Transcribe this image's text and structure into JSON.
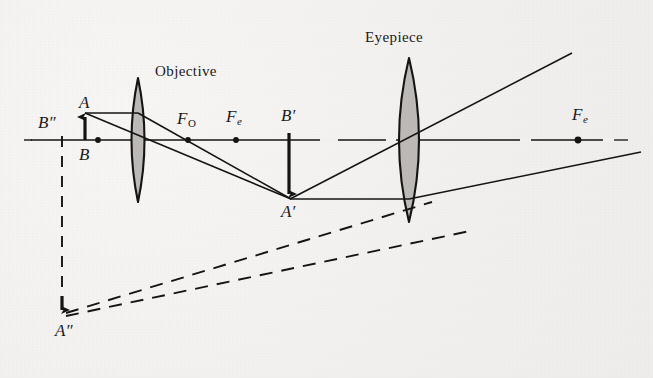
{
  "figure": {
    "kind": "optical-ray-diagram",
    "background_color": "#f2f1ef",
    "ink_color": "#141414",
    "lens_fill_color": "#b8b5b2",
    "width": 653,
    "height": 378
  },
  "titles": {
    "objective": "Objective",
    "eyepiece": "Eyepiece"
  },
  "labels": {
    "A": "A",
    "B": "B",
    "B_double_prime": "B",
    "B_double_prime_marks": "″",
    "F_objective": "F",
    "F_objective_sub": "O",
    "F_eyepiece_left": "F",
    "F_eyepiece_left_sub": "e",
    "B_prime": "B",
    "B_prime_mark": "′",
    "A_prime": "A",
    "A_prime_mark": "′",
    "F_eyepiece_right": "F",
    "F_eyepiece_right_sub": "e",
    "A_double_prime": "A",
    "A_double_prime_marks": "″"
  },
  "optical_elements": {
    "axis": {
      "name": "optical-axis",
      "y": 140,
      "x_start": 24,
      "x_end": 640,
      "style": "dash-dot"
    },
    "objective_lens": {
      "name": "objective-lens",
      "center_x": 138,
      "center_y": 140,
      "half_height": 62,
      "half_width": 13
    },
    "eyepiece_lens": {
      "name": "eyepiece-lens",
      "center_x": 409,
      "center_y": 140,
      "half_height": 82,
      "half_width": 20
    },
    "points": [
      {
        "name": "F-objective-front",
        "x": 98,
        "y": 140,
        "labeled": false
      },
      {
        "name": "F-objective-back",
        "x": 188,
        "y": 140,
        "labeled": true
      },
      {
        "name": "F-eyepiece-left",
        "x": 236,
        "y": 140,
        "labeled": true
      },
      {
        "name": "F-eyepiece-right",
        "x": 578,
        "y": 140,
        "labeled": true
      }
    ],
    "object_arrow": {
      "name": "object-AB",
      "x": 85,
      "base_y": 140,
      "tip_y": 113,
      "direction": "up"
    },
    "intermediate_image_arrow": {
      "name": "intermediate-image-A-prime-B-prime",
      "x": 289,
      "base_y": 140,
      "tip_y": 199,
      "direction": "down"
    },
    "virtual_image_arrow": {
      "name": "virtual-image-A-double-prime-B-double-prime",
      "x": 62,
      "base_y": 140,
      "tip_y": 316,
      "direction": "down",
      "style": "dashed"
    }
  },
  "rays": [
    {
      "name": "ray-parallel-to-axis-from-A",
      "from": [
        85,
        113
      ],
      "to": [
        289,
        199
      ],
      "style": "solid"
    },
    {
      "name": "ray-through-objective-center",
      "from": [
        85,
        113
      ],
      "to": [
        289,
        199
      ],
      "style": "solid"
    },
    {
      "name": "ray-from-A-prime-upper-through-eyepiece",
      "from": [
        289,
        199
      ],
      "to": [
        572,
        53
      ],
      "style": "solid"
    },
    {
      "name": "ray-from-A-prime-horizontal-to-eyepiece",
      "from": [
        289,
        199
      ],
      "to": [
        409,
        199
      ],
      "style": "solid"
    },
    {
      "name": "ray-refracted-to-F-eyepiece-right",
      "from": [
        409,
        199
      ],
      "to": [
        640,
        151
      ],
      "style": "solid"
    },
    {
      "name": "virtual-ray-back-to-A-double-prime-upper",
      "from": [
        62,
        316
      ],
      "to": [
        420,
        205
      ],
      "style": "dashed"
    },
    {
      "name": "virtual-ray-back-to-A-double-prime-lower",
      "from": [
        62,
        316
      ],
      "to": [
        460,
        230
      ],
      "style": "dashed"
    }
  ]
}
